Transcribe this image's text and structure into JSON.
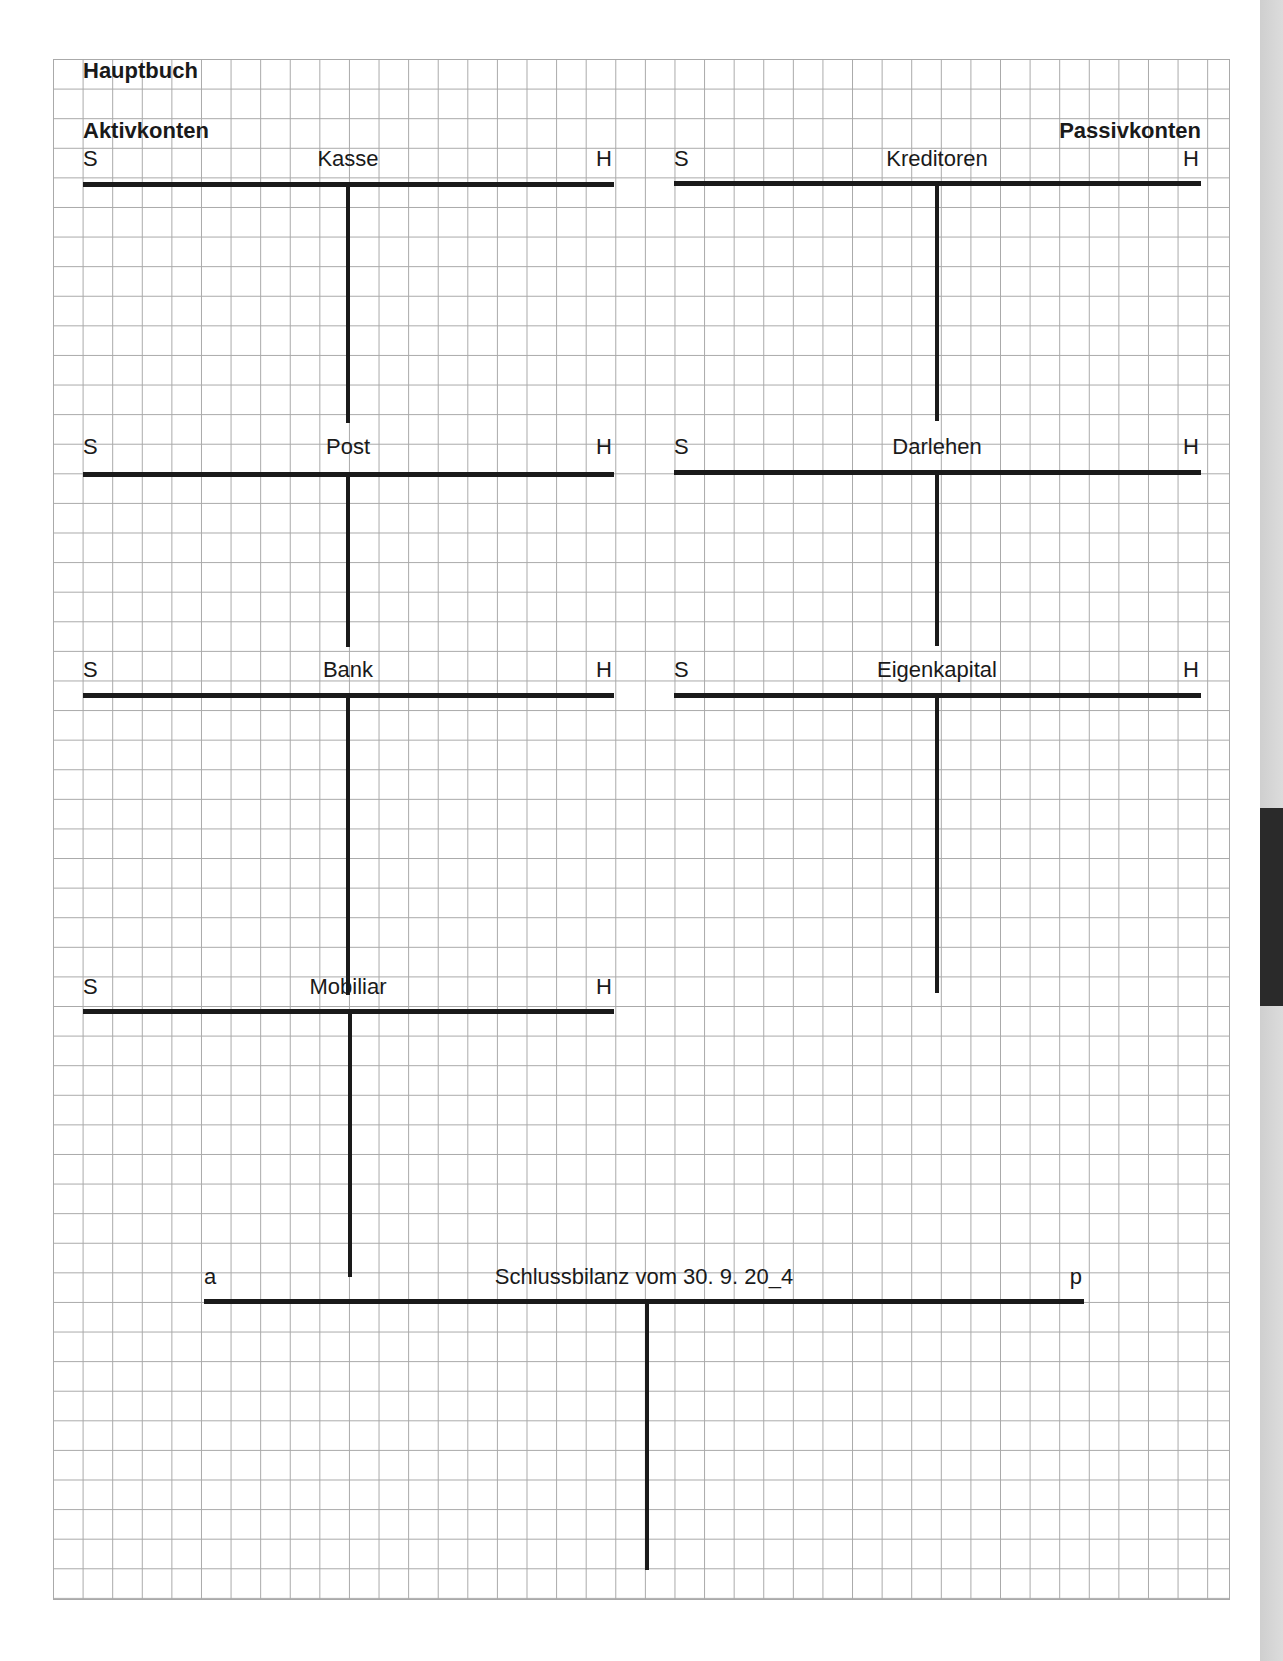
{
  "page": {
    "title": "Hauptbuch",
    "left_section": "Aktivkonten",
    "right_section": "Passivkonten"
  },
  "colors": {
    "grid_line": "#a9a9a9",
    "ink": "#1a1a1a",
    "side_strip": "#d4d4d4",
    "side_tab": "#2a2a2a"
  },
  "accounts": {
    "kasse": {
      "title": "Kasse",
      "left": "S",
      "right": "H"
    },
    "post": {
      "title": "Post",
      "left": "S",
      "right": "H"
    },
    "bank": {
      "title": "Bank",
      "left": "S",
      "right": "H"
    },
    "mobiliar": {
      "title": "Mobiliar",
      "left": "S",
      "right": "H"
    },
    "kreditoren": {
      "title": "Kreditoren",
      "left": "S",
      "right": "H"
    },
    "darlehen": {
      "title": "Darlehen",
      "left": "S",
      "right": "H"
    },
    "eigenkapital": {
      "title": "Eigenkapital",
      "left": "S",
      "right": "H"
    },
    "schlussbilanz": {
      "title": "Schlussbilanz vom 30. 9. 20_4",
      "left": "a",
      "right": "p"
    }
  }
}
